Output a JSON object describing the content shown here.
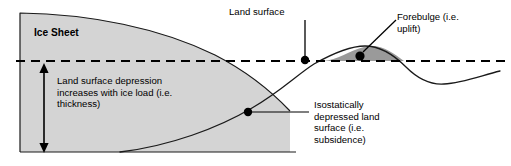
{
  "diagram": {
    "colors": {
      "ice_fill": "#d4d4d4",
      "forebulge_fill": "#9a9a9a",
      "outline": "#1a1a1a",
      "text": "#000000",
      "background": "#ffffff"
    },
    "labels": {
      "ice_sheet": "Ice Sheet",
      "depression": "Land surface depression increases with ice load (i.e. thickness)",
      "land_surface": "Land surface",
      "forebulge": "Forebulge (i.e. uplift)",
      "isostatic": "Isostatically depressed land surface (i.e. subsidence)"
    },
    "features": [
      {
        "name": "ice-sheet-body",
        "description": "Grey wedge representing the ice sheet, thickest at left, tapering to the right"
      },
      {
        "name": "datum-line",
        "description": "Horizontal black dashed line marking the undeformed land surface datum",
        "style": "dashed"
      },
      {
        "name": "depression-arrow",
        "description": "Vertical double-headed arrow showing the depth of land surface depression"
      },
      {
        "name": "forebulge-region",
        "description": "Dark grey lens of uplifted crust beyond the ice margin"
      },
      {
        "name": "depressed-surface-curve",
        "description": "Solid curve tracing the isostatically depressed land surface, rising to the forebulge and dipping beyond"
      }
    ],
    "leaders": [
      {
        "name": "land-surface-leader",
        "from_label": "land_surface",
        "marker": "dot"
      },
      {
        "name": "forebulge-leader",
        "from_label": "forebulge",
        "marker": "dot"
      },
      {
        "name": "isostatic-leader",
        "from_label": "isostatic",
        "marker": "dot"
      }
    ]
  }
}
